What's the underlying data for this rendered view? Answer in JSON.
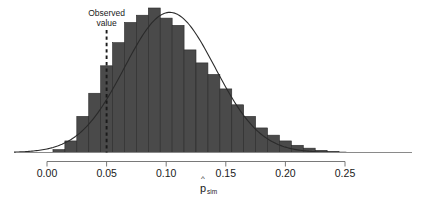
{
  "chart_data": {
    "type": "bar",
    "title": "",
    "subtitle": "",
    "xlabel": "p̂",
    "xlabel_base": "p",
    "xlabel_hat": "^",
    "xlabel_subscript": "sim",
    "ylabel": "",
    "xlim": [
      -0.012,
      0.262
    ],
    "ylim": [
      0,
      1.0
    ],
    "grid": false,
    "legend": "none",
    "bin_width": 0.02,
    "xticks": [
      "0.00",
      "0.05",
      "0.10",
      "0.15",
      "0.20",
      "0.25"
    ],
    "xtick_values": [
      0.0,
      0.05,
      0.1,
      0.15,
      0.2,
      0.25
    ],
    "categories": [
      0.01,
      0.02,
      0.03,
      0.04,
      0.05,
      0.06,
      0.07,
      0.08,
      0.09,
      0.1,
      0.11,
      0.12,
      0.13,
      0.14,
      0.15,
      0.16,
      0.17,
      0.18,
      0.19,
      0.2,
      0.21,
      0.22,
      0.23,
      0.24
    ],
    "values": [
      0.02,
      0.08,
      0.25,
      0.41,
      0.6,
      0.76,
      0.9,
      0.95,
      1.0,
      0.93,
      0.88,
      0.71,
      0.62,
      0.54,
      0.44,
      0.33,
      0.25,
      0.17,
      0.12,
      0.08,
      0.05,
      0.03,
      0.015,
      0.008
    ],
    "bar_color": "#4a4a4a",
    "bar_edge_color": "#2a2a2a",
    "curve": {
      "name": "normal density overlay",
      "color": "#2a2a2a",
      "mean": 0.103,
      "sd": 0.038,
      "peak_value": 0.97
    },
    "annotations": [
      {
        "name": "observed-value",
        "label_line1": "Observed",
        "label_line2": "value",
        "x": 0.05,
        "line_style": "dashed",
        "color": "#1a1a1a"
      }
    ]
  }
}
